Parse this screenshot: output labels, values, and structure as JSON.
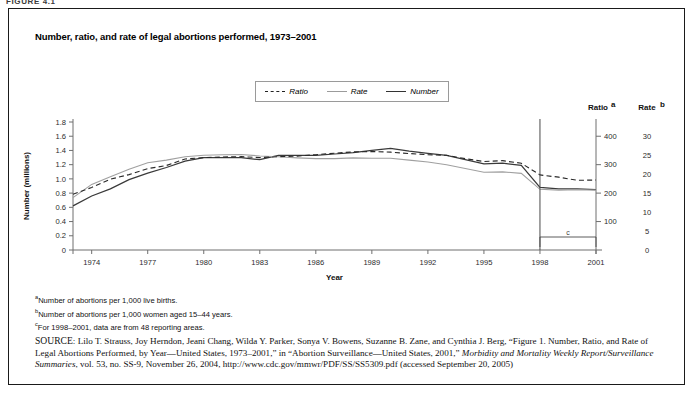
{
  "figure_label": "FIGURE 4.1",
  "chart_title": "Number, ratio, and rate of legal abortions performed,  1973–2001",
  "legend": {
    "items": [
      {
        "label": "Ratio",
        "style": "dashed",
        "color": "#2a2a2a"
      },
      {
        "label": "Rate",
        "style": "solid-light",
        "color": "#a0a0a0"
      },
      {
        "label": "Number",
        "style": "solid-dark",
        "color": "#3a3a3a"
      }
    ]
  },
  "axes": {
    "x_title": "Year",
    "left_title": "Number (millions)",
    "right1_title": "Ratio",
    "right1_sup": "a",
    "right2_title": "Rate",
    "right2_sup": "b",
    "x_ticklabels": [
      "1974",
      "1977",
      "1980",
      "1983",
      "1986",
      "1989",
      "1992",
      "1995",
      "1998",
      "2001"
    ],
    "left_ticklabels": [
      "1.8",
      "1.6",
      "1.4",
      "1.2",
      "1.0",
      "0.8",
      "0.6",
      "0.4",
      "0.2",
      "0"
    ],
    "right1_ticklabels": [
      "400",
      "300",
      "200",
      "100"
    ],
    "right2_ticklabels": [
      "30",
      "25",
      "20",
      "15",
      "10",
      "5",
      "0"
    ]
  },
  "annotations": {
    "break_marker_year": "1998",
    "bracket_label": "c"
  },
  "footnotes": [
    {
      "sup": "a",
      "text": "Number of abortions per 1,000 live births."
    },
    {
      "sup": "b",
      "text": "Number of abortions per 1,000 women aged 15–44 years."
    },
    {
      "sup": "c",
      "text": "For 1998–2001, data are from 48 reporting areas."
    }
  ],
  "source": {
    "prefix": "SOURCE",
    "text_1": ": Lilo T. Strauss, Joy Herndon, Jeani Chang, Wilda Y. Parker, Sonya V. Bowens, Suzanne B. Zane, and Cynthia J. Berg, “Figure 1. Number, Ratio, and Rate of Legal Abortions Performed, by Year—United States, 1973–2001,” in “Abortion Surveillance—United States, 2001,” ",
    "italic_1": "Morbidity and Mortality Weekly Report/Surveillance Summaries",
    "text_2": ", vol. 53, no. SS-9, November 26, 2004, http://www.cdc.gov/mmwr/PDF/SS/SS5309.pdf (accessed September 20, 2005)"
  },
  "chart_data": {
    "type": "line",
    "title": "Number, ratio, and rate of legal abortions performed, 1973–2001",
    "xlabel": "Year",
    "ylabel": "Number (millions)",
    "grid": false,
    "legend_position": "top-center",
    "x": [
      1973,
      1974,
      1975,
      1976,
      1977,
      1978,
      1979,
      1980,
      1981,
      1982,
      1983,
      1984,
      1985,
      1986,
      1987,
      1988,
      1989,
      1990,
      1991,
      1992,
      1993,
      1994,
      1995,
      1996,
      1997,
      1998,
      1999,
      2000,
      2001
    ],
    "axis_ranges": {
      "number_millions": [
        0,
        1.8
      ],
      "ratio_per_1000_live_births": [
        0,
        400
      ],
      "rate_per_1000_women_15_44": [
        0,
        30
      ]
    },
    "series": [
      {
        "name": "Number",
        "units": "millions of abortions",
        "axis": "left",
        "style": "solid-dark",
        "values": [
          0.62,
          0.76,
          0.86,
          0.99,
          1.08,
          1.16,
          1.25,
          1.3,
          1.3,
          1.3,
          1.27,
          1.33,
          1.33,
          1.33,
          1.35,
          1.37,
          1.4,
          1.43,
          1.39,
          1.36,
          1.33,
          1.27,
          1.21,
          1.22,
          1.19,
          0.88,
          0.86,
          0.86,
          0.85
        ]
      },
      {
        "name": "Rate",
        "units": "abortions per 1,000 women aged 15–44 years",
        "axis": "right2",
        "style": "solid-light",
        "values": [
          13.8,
          17.3,
          19.3,
          21.3,
          23.0,
          23.7,
          24.6,
          25.0,
          25.1,
          25.2,
          24.8,
          24.6,
          24.3,
          24.1,
          24.1,
          24.3,
          24.2,
          24.2,
          23.7,
          23.2,
          22.5,
          21.5,
          20.5,
          20.6,
          20.2,
          16.0,
          15.8,
          15.9,
          15.8
        ]
      },
      {
        "name": "Ratio",
        "units": "abortions per 1,000 live births",
        "axis": "right1",
        "style": "dashed",
        "values": [
          196,
          220,
          249,
          265,
          286,
          297,
          320,
          325,
          327,
          328,
          325,
          328,
          330,
          335,
          340,
          345,
          346,
          344,
          339,
          335,
          333,
          321,
          311,
          314,
          305,
          264,
          256,
          245,
          246
        ]
      }
    ],
    "notes": [
      "For 1998–2001, data are from 48 reporting areas.",
      "A vertical break marker is drawn at 1998."
    ]
  }
}
